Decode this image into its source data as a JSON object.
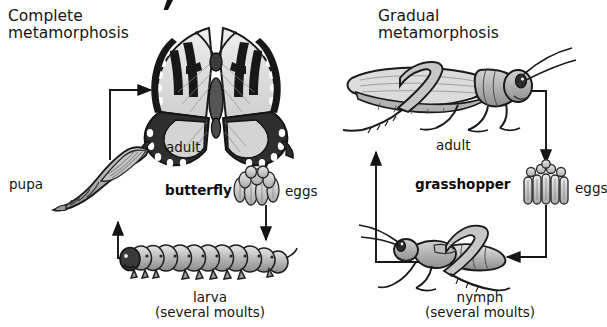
{
  "diagram": {
    "title_clipped_glyph": "⁄",
    "background_color": "#ffffff",
    "ink_color": "#141414",
    "fill_light": "#d8d8d8",
    "fill_mid": "#a8a8a8",
    "fill_dark": "#4a4a4a"
  },
  "panels": [
    {
      "id": "complete-metamorphosis",
      "heading_line1": "Complete",
      "heading_line2": "metamorphosis",
      "stage_adult_label": "adult",
      "stage_adult_name": "butterfly",
      "stage_eggs_label": "eggs",
      "stage_larva_label": "larva",
      "stage_larva_sub": "(several moults)",
      "stage_pupa_label": "pupa",
      "organism": "butterfly",
      "icons": {
        "adult": "butterfly-icon",
        "eggs": "egg-cluster-icon",
        "larva": "caterpillar-icon",
        "pupa": "chrysalis-icon"
      }
    },
    {
      "id": "gradual-metamorphosis",
      "heading_line1": "Gradual",
      "heading_line2": "metamorphosis",
      "stage_adult_label": "adult",
      "stage_adult_name": "grasshopper",
      "stage_eggs_label": "eggs",
      "stage_nymph_label": "nymph",
      "stage_nymph_sub": "(several moults)",
      "organism": "grasshopper",
      "icons": {
        "adult": "grasshopper-adult-icon",
        "eggs": "egg-pod-icon",
        "nymph": "grasshopper-nymph-icon"
      }
    }
  ],
  "arrows": [
    {
      "name": "pupa-to-adult-arrow",
      "from": "pupa",
      "to": "adult",
      "direction": "up-then-right"
    },
    {
      "name": "adult-to-eggs-arrow",
      "from": "adult",
      "to": "eggs",
      "direction": "down"
    },
    {
      "name": "eggs-to-larva-arrow",
      "from": "eggs",
      "to": "larva",
      "direction": "down"
    },
    {
      "name": "larva-to-pupa-arrow",
      "from": "larva",
      "to": "pupa",
      "direction": "left-then-up"
    },
    {
      "name": "adult-to-eggs-arrow-gradual",
      "from": "adult",
      "to": "eggs",
      "direction": "right-then-down"
    },
    {
      "name": "eggs-to-nymph-arrow",
      "from": "eggs",
      "to": "nymph",
      "direction": "down-then-left"
    },
    {
      "name": "nymph-to-adult-arrow",
      "from": "nymph",
      "to": "adult",
      "direction": "left-then-up"
    }
  ]
}
